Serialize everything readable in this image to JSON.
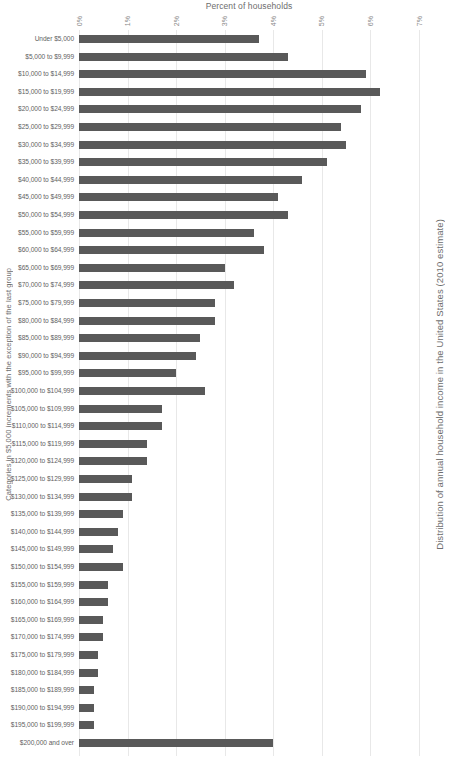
{
  "chart_data": {
    "type": "bar",
    "orientation": "horizontal",
    "title": "Distribution of annual household income in the United States (2010 estimate)",
    "xlabel": "Percent of households",
    "ylabel": "Categories in $5,000 increments with the exception of the last group",
    "xlim": [
      0,
      7
    ],
    "xticks": [
      "0%",
      "1%",
      "2%",
      "3%",
      "4%",
      "5%",
      "6%",
      "7%"
    ],
    "xtick_values": [
      0,
      1,
      2,
      3,
      4,
      5,
      6,
      7
    ],
    "grid": true,
    "legend": "none",
    "bar_color": "#595959",
    "gridline_color": "#e8e8e8",
    "categories": [
      "Under $5,000",
      "$5,000 to $9,999",
      "$10,000 to $14,999",
      "$15,000 to $19,999",
      "$20,000 to $24,999",
      "$25,000 to $29,999",
      "$30,000 to $34,999",
      "$35,000 to $39,999",
      "$40,000 to $44,999",
      "$45,000 to $49,999",
      "$50,000 to $54,999",
      "$55,000 to $59,999",
      "$60,000 to $64,999",
      "$65,000 to $69,999",
      "$70,000 to $74,999",
      "$75,000 to $79,999",
      "$80,000 to $84,999",
      "$85,000 to $89,999",
      "$90,000 to $94,999",
      "$95,000 to $99,999",
      "$100,000 to $104,999",
      "$105,000 to $109,999",
      "$110,000 to $114,999",
      "$115,000 to $119,999",
      "$120,000 to $124,999",
      "$125,000 to $129,999",
      "$130,000 to $134,999",
      "$135,000 to $139,999",
      "$140,000 to $144,999",
      "$145,000 to $149,999",
      "$150,000 to $154,999",
      "$155,000 to $159,999",
      "$160,000 to $164,999",
      "$165,000 to $169,999",
      "$170,000 to $174,999",
      "$175,000 to $179,999",
      "$180,000 to $184,999",
      "$185,000 to $189,999",
      "$190,000 to $194,999",
      "$195,000 to $199,999",
      "$200,000 and over"
    ],
    "values": [
      3.7,
      4.3,
      5.9,
      6.2,
      5.8,
      5.4,
      5.5,
      5.1,
      4.6,
      4.1,
      4.3,
      3.6,
      3.8,
      3.0,
      3.2,
      2.8,
      2.8,
      2.5,
      2.4,
      2.0,
      2.6,
      1.7,
      1.7,
      1.4,
      1.4,
      1.1,
      1.1,
      0.9,
      0.8,
      0.7,
      0.9,
      0.6,
      0.6,
      0.5,
      0.5,
      0.4,
      0.4,
      0.3,
      0.3,
      0.3,
      4.0
    ]
  }
}
